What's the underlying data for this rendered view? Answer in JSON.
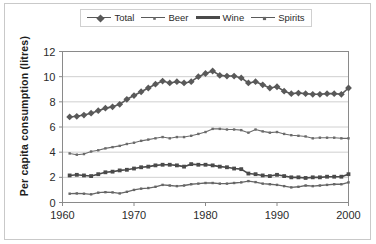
{
  "chart_data": {
    "type": "line",
    "title": "",
    "xlabel": "",
    "ylabel": "Per capita consumption (litres)",
    "xlim": [
      1960,
      2000
    ],
    "ylim": [
      0,
      12
    ],
    "yticks": [
      0,
      2,
      4,
      6,
      8,
      10,
      12
    ],
    "xticks": [
      1960,
      1970,
      1980,
      1990,
      2000
    ],
    "grid": "horizontal",
    "legend_position": "top-center",
    "x": [
      1961,
      1962,
      1963,
      1964,
      1965,
      1966,
      1967,
      1968,
      1969,
      1970,
      1971,
      1972,
      1973,
      1974,
      1975,
      1976,
      1977,
      1978,
      1979,
      1980,
      1981,
      1982,
      1983,
      1984,
      1985,
      1986,
      1987,
      1988,
      1989,
      1990,
      1991,
      1992,
      1993,
      1994,
      1995,
      1996,
      1997,
      1998,
      1999,
      2000
    ],
    "series": [
      {
        "name": "Total",
        "marker": "diamond",
        "color": "#595959",
        "values": [
          6.8,
          6.85,
          6.95,
          7.1,
          7.3,
          7.5,
          7.6,
          7.8,
          8.2,
          8.5,
          8.8,
          9.1,
          9.4,
          9.65,
          9.5,
          9.6,
          9.5,
          9.6,
          10.0,
          10.25,
          10.45,
          10.1,
          10.05,
          10.05,
          9.9,
          9.5,
          9.6,
          9.35,
          9.1,
          9.2,
          8.85,
          8.65,
          8.7,
          8.65,
          8.6,
          8.6,
          8.65,
          8.65,
          8.6,
          9.1
        ]
      },
      {
        "name": "Beer",
        "marker": "dot",
        "color": "#6b6b6b",
        "values": [
          3.9,
          3.8,
          3.85,
          4.05,
          4.15,
          4.3,
          4.4,
          4.5,
          4.65,
          4.75,
          4.9,
          5.0,
          5.1,
          5.2,
          5.1,
          5.2,
          5.2,
          5.3,
          5.45,
          5.6,
          5.85,
          5.85,
          5.8,
          5.8,
          5.75,
          5.55,
          5.8,
          5.65,
          5.55,
          5.6,
          5.45,
          5.35,
          5.3,
          5.25,
          5.1,
          5.15,
          5.15,
          5.15,
          5.1,
          5.1
        ]
      },
      {
        "name": "Wine",
        "marker": "square",
        "color": "#4a4a4a",
        "values": [
          2.15,
          2.2,
          2.15,
          2.1,
          2.25,
          2.4,
          2.45,
          2.55,
          2.6,
          2.7,
          2.8,
          2.85,
          2.95,
          3.0,
          3.0,
          2.95,
          2.85,
          3.05,
          3.0,
          3.0,
          2.95,
          2.85,
          2.8,
          2.7,
          2.65,
          2.3,
          2.25,
          2.15,
          2.1,
          2.2,
          2.1,
          2.0,
          2.0,
          1.95,
          2.0,
          2.0,
          2.05,
          2.05,
          2.05,
          2.25
        ]
      },
      {
        "name": "Spirits",
        "marker": "dot",
        "color": "#666666",
        "values": [
          0.7,
          0.72,
          0.7,
          0.65,
          0.78,
          0.82,
          0.8,
          0.72,
          0.85,
          1.0,
          1.1,
          1.15,
          1.25,
          1.4,
          1.35,
          1.3,
          1.35,
          1.45,
          1.5,
          1.55,
          1.55,
          1.5,
          1.5,
          1.55,
          1.6,
          1.7,
          1.62,
          1.5,
          1.45,
          1.4,
          1.3,
          1.2,
          1.25,
          1.35,
          1.3,
          1.35,
          1.4,
          1.45,
          1.45,
          1.6
        ]
      }
    ]
  },
  "legend": {
    "items": [
      {
        "label": "Total"
      },
      {
        "label": "Beer"
      },
      {
        "label": "Wine"
      },
      {
        "label": "Spirits"
      }
    ]
  },
  "axes": {
    "y_title": "Per capita consumption (litres)",
    "y_ticks": [
      "12",
      "10",
      "8",
      "6",
      "4",
      "2",
      "0"
    ],
    "x_ticks": [
      "1960",
      "1970",
      "1980",
      "1990",
      "2000"
    ]
  }
}
